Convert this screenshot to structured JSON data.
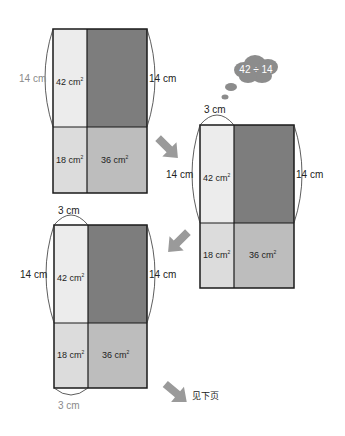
{
  "colors": {
    "outline": "#1a1a1a",
    "strip_top": "#ececec",
    "dark_block": "#7d7d7d",
    "strip_bottom": "#dcdcdc",
    "bottom_right": "#bdbdbd",
    "arrow": "#9a9a9a",
    "cloud": "#8c8c8c",
    "arc": "#333333",
    "gray_text": "#8a8a8a"
  },
  "figures": [
    {
      "id": "figure-1",
      "left_label": "14 cm",
      "right_label": "14 cm",
      "top_left_area": "42 cm",
      "bottom_left_area": "18 cm",
      "bottom_right_area": "36 cm",
      "area_unit_exponent": "2"
    },
    {
      "id": "figure-2",
      "top_label": "3 cm",
      "left_label": "14 cm",
      "right_label": "14 cm",
      "top_left_area": "42 cm",
      "bottom_left_area": "18 cm",
      "bottom_right_area": "36 cm",
      "area_unit_exponent": "2",
      "thought": "42 ÷ 14"
    },
    {
      "id": "figure-3",
      "top_label": "3 cm",
      "bottom_label": "3 cm",
      "left_label": "14 cm",
      "right_label": "14 cm",
      "top_left_area": "42 cm",
      "bottom_left_area": "18 cm",
      "bottom_right_area": "36 cm",
      "area_unit_exponent": "2"
    }
  ],
  "footer": {
    "continue_label": "见下页"
  }
}
